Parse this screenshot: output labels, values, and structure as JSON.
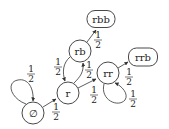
{
  "diagram": {
    "type": "state-transition",
    "nodes": [
      {
        "id": "empty",
        "label": "∅",
        "shape": "circle",
        "cx": 33,
        "cy": 113,
        "r": 11
      },
      {
        "id": "r",
        "label": "r",
        "shape": "circle",
        "cx": 68,
        "cy": 93,
        "r": 11
      },
      {
        "id": "rb",
        "label": "rb",
        "shape": "circle",
        "cx": 80,
        "cy": 51,
        "r": 11
      },
      {
        "id": "rr",
        "label": "rr",
        "shape": "circle",
        "cx": 108,
        "cy": 73,
        "r": 11
      },
      {
        "id": "rbb",
        "label": "rbb",
        "shape": "rounded",
        "cx": 101,
        "cy": 19,
        "w": 28,
        "h": 17
      },
      {
        "id": "rrb",
        "label": "rrb",
        "shape": "rounded",
        "cx": 143,
        "cy": 57,
        "w": 29,
        "h": 18
      }
    ],
    "edges": [
      {
        "from": "empty",
        "to": "empty",
        "label": "1/2",
        "path": "M26,104 C10,98 6,82 18,80 C28,78 34,88 33,101",
        "lx": 31,
        "ly": 74
      },
      {
        "from": "empty",
        "to": "r",
        "label": "1/2",
        "path": "M43,107 L56,99",
        "lx": 56,
        "ly": 112
      },
      {
        "from": "r",
        "to": "rb",
        "label": "1/2",
        "path": "M74,83 C80,77 84,72 83,63",
        "lx": 89,
        "ly": 70
      },
      {
        "from": "rb",
        "to": "r",
        "label": "1/2",
        "path": "M70,57 C63,63 62,72 65,81",
        "lx": 58,
        "ly": 67
      },
      {
        "from": "r",
        "to": "rr",
        "label": "1/2",
        "path": "M78,88 L96,79",
        "lx": 94,
        "ly": 95
      },
      {
        "from": "rb",
        "to": "rbb",
        "label": "1/2",
        "path": "M87,42 L96,30",
        "lx": 98,
        "ly": 40
      },
      {
        "from": "rr",
        "to": "rrb",
        "label": "1/2",
        "path": "M118,68 L128,62",
        "lx": 129,
        "ly": 77
      },
      {
        "from": "rr",
        "to": "rr",
        "label": "1/2",
        "path": "M104,84 C100,100 118,108 125,100 C129,94 122,86 115,83",
        "lx": 133,
        "ly": 99
      }
    ]
  }
}
